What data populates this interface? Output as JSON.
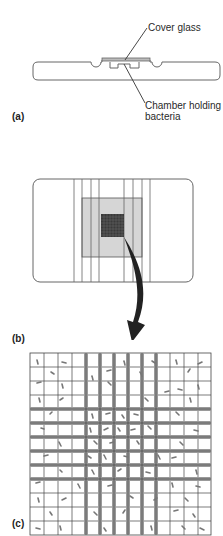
{
  "figure": {
    "panels": [
      {
        "id": "a",
        "label": "(a)",
        "description": "Side view of counting chamber slide"
      },
      {
        "id": "b",
        "label": "(b)",
        "description": "Top view of slide with ruled grid area"
      },
      {
        "id": "c",
        "label": "(c)",
        "description": "Magnified grid with bacteria"
      }
    ],
    "annotations": {
      "cover_glass": "Cover glass",
      "chamber_line1": "Chamber holding",
      "chamber_line2": "bacteria"
    }
  },
  "colors": {
    "line": "#555555",
    "grid_dark": "#333333",
    "shaded": "#d4d4d4",
    "bacteria": "#777777",
    "arrow": "#222222"
  }
}
